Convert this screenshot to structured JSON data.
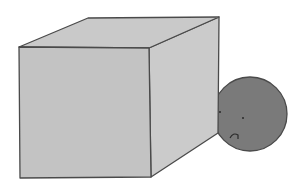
{
  "illustration": {
    "description": "Gray cube with a sad-faced dark gray circle peeking from behind its right side",
    "colors": {
      "background": "#ffffff",
      "cube_front": "#c3c3c3",
      "cube_top": "#c9c9c9",
      "cube_side": "#cbcbcb",
      "outline": "#4a4a4a",
      "circle_fill": "#7a7a7a",
      "face_marks": "#2a2a2a"
    },
    "cube": {
      "front": "19,47 149,48 151,177 20,178",
      "top": "19,47 88,18 219,17 149,48",
      "side": "149,48 219,17 218,133 151,177"
    },
    "circle": {
      "cx": 250,
      "cy": 114,
      "r": 37,
      "expression": "sad"
    }
  }
}
